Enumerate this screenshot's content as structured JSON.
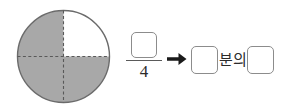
{
  "worksheet": {
    "type": "fraction-shading-exercise",
    "language": "ko"
  },
  "diagram": {
    "shape": "circle",
    "total_parts": 4,
    "shaded_parts": 3,
    "unshaded_parts": 1,
    "unshaded_quadrant": "top-right",
    "divider_style": "dashed",
    "outline_color": "#6b6b6b",
    "shaded_color": "#a8a8a8",
    "unshaded_color": "#ffffff"
  },
  "expression": {
    "numerator_value": "",
    "numerator_placeholder": "",
    "denominator": "4",
    "arrow_glyph": "→",
    "result_first_value": "",
    "result_first_placeholder": "",
    "connector_text": "분의",
    "result_second_value": "",
    "result_second_placeholder": ""
  }
}
